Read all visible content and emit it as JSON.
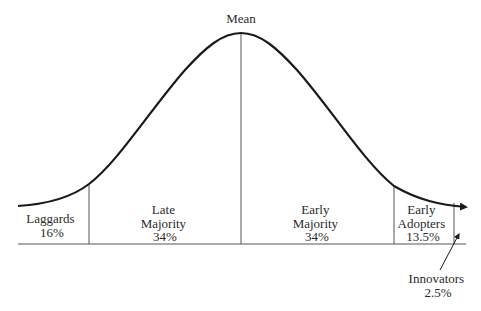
{
  "diagram": {
    "mean_label": "Mean",
    "colors": {
      "ink": "#1a1a1a",
      "text": "#2a2a2a",
      "background": "#ffffff"
    },
    "segments": [
      {
        "name": "Laggards",
        "line1": "Laggards",
        "line2": "16%",
        "percent": 16
      },
      {
        "name": "Late Majority",
        "line1": "Late",
        "line2": "Majority",
        "line3": "34%",
        "percent": 34
      },
      {
        "name": "Early Majority",
        "line1": "Early",
        "line2": "Majority",
        "line3": "34%",
        "percent": 34
      },
      {
        "name": "Early Adopters",
        "line1": "Early",
        "line2": "Adopters",
        "line3": "13.5%",
        "percent": 13.5
      },
      {
        "name": "Innovators",
        "line1": "Innovators",
        "line2": "2.5%",
        "percent": 2.5
      }
    ]
  }
}
